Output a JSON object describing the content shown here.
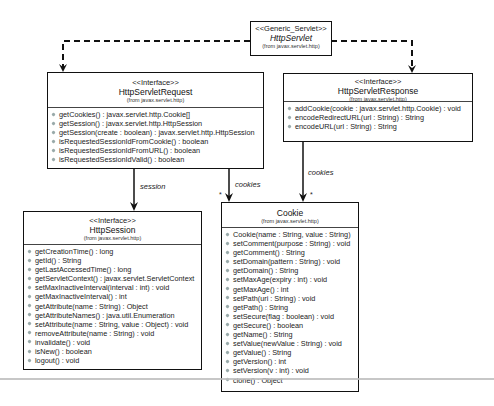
{
  "diagram": {
    "type": "UML class diagram",
    "classes": {
      "http_servlet": {
        "stereotype": "<<Generic_Servlet>>",
        "name": "HttpServlet",
        "package": "(from javax.servlet.http)"
      },
      "request": {
        "stereotype": "<<Interface>>",
        "name": "HttpServletRequest",
        "package": "(from javax.servlet.http)",
        "operations": [
          "getCookies() : javax.servlet.http.Cookie[]",
          "getSession() : javax.servlet.http.HttpSession",
          "getSession(create : boolean) : javax.servlet.http.HttpSession",
          "isRequestedSessionIdFromCookie() : boolean",
          "isRequestedSessionIdFromURL() : boolean",
          "isRequestedSessionIdValid() : boolean"
        ]
      },
      "response": {
        "stereotype": "<<Interface>>",
        "name": "HttpServletResponse",
        "package": "(from javax.servlet.http)",
        "operations": [
          "addCookie(cookie : javax.servlet.http.Cookie) : void",
          "encodeRedirectURL(url : String) : String",
          "encodeURL(url : String) : String"
        ]
      },
      "session": {
        "stereotype": "<<Interface>>",
        "name": "HttpSession",
        "package": "(from javax.servlet.http)",
        "operations": [
          "getCreationTime() : long",
          "getId() : String",
          "getLastAccessedTime() : long",
          "getServletContext() : javax.servlet.ServletContext",
          "setMaxInactiveInterval(interval : int) : void",
          "getMaxInactiveInterval() : int",
          "getAttribute(name : String) : Object",
          "getAttributeNames() : java.util.Enumeration",
          "setAttribute(name : String, value : Object) : void",
          "removeAttribute(name : String) : void",
          "invalidate() : void",
          "isNew() : boolean",
          "logout() : void"
        ]
      },
      "cookie": {
        "name": "Cookie",
        "package": "(from javax.servlet.http)",
        "operations": [
          "Cookie(name : String, value : String)",
          "setComment(purpose : String) : void",
          "getComment() : String",
          "setDomain(pattern : String) : void",
          "getDomain() : String",
          "setMaxAge(expiry : int) : void",
          "getMaxAge() : int",
          "setPath(uri : String) : void",
          "getPath() : String",
          "setSecure(flag : boolean) : void",
          "getSecure() : boolean",
          "getName() : String",
          "setValue(newValue : String) : void",
          "getValue() : String",
          "getVersion() : int",
          "setVersion(v : int) : void",
          "clone() : Object"
        ]
      }
    },
    "associations": {
      "session_label": "session",
      "request_cookies_label": "cookies",
      "response_cookies_label": "cookies",
      "request_cookies_mult": "*",
      "response_cookies_mult": "*"
    }
  }
}
